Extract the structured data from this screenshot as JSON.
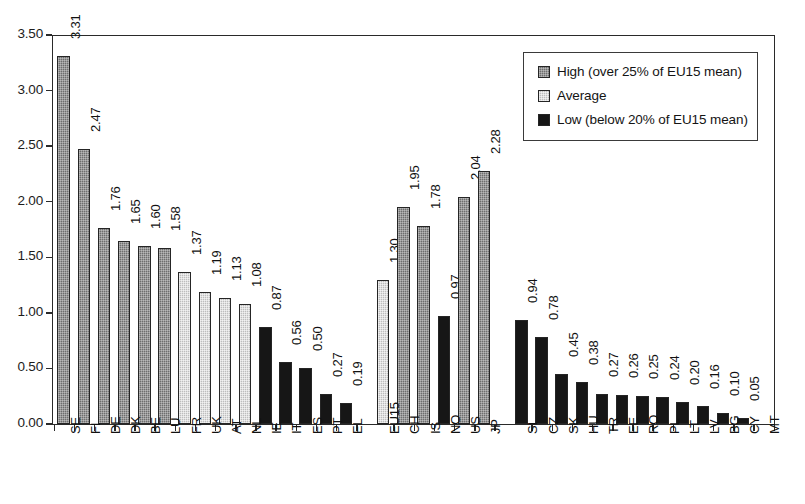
{
  "chart_data": {
    "type": "bar",
    "title": "",
    "xlabel": "",
    "ylabel": "",
    "ylim": [
      0.0,
      3.5
    ],
    "ytick_step": 0.5,
    "ytick_labels": [
      "0.00",
      "0.50",
      "1.00",
      "1.50",
      "2.00",
      "2.50",
      "3.00",
      "3.50"
    ],
    "grid": false,
    "legend_position": "top-right",
    "value_labels_rotated": true,
    "category_labels_rotated": true,
    "categories": [
      "SE",
      "FI",
      "DE",
      "DK",
      "BE",
      "LU",
      "FR",
      "UK",
      "AT",
      "NL",
      "IE",
      "IT",
      "ES",
      "PT",
      "EL",
      "EU15",
      "CH",
      "IS",
      "NO",
      "US",
      "JP",
      "SI",
      "CZ",
      "SK",
      "HU",
      "TR",
      "EE",
      "RO",
      "PL",
      "LT",
      "LV",
      "BG",
      "CY",
      "MT"
    ],
    "values": [
      3.31,
      2.47,
      1.76,
      1.65,
      1.6,
      1.58,
      1.37,
      1.19,
      1.13,
      1.08,
      0.87,
      0.56,
      0.5,
      0.27,
      0.19,
      1.3,
      1.95,
      1.78,
      0.97,
      2.04,
      2.28,
      0.94,
      0.78,
      0.45,
      0.38,
      0.27,
      0.26,
      0.25,
      0.24,
      0.2,
      0.16,
      0.1,
      0.05,
      0.0
    ],
    "value_labels": [
      "3.31",
      "2.47",
      "1.76",
      "1.65",
      "1.60",
      "1.58",
      "1.37",
      "1.19",
      "1.13",
      "1.08",
      "0.87",
      "0.56",
      "0.50",
      "0.27",
      "0.19",
      "1.30",
      "1.95",
      "1.78",
      "0.97",
      "2.04",
      "2.28",
      "0.94",
      "0.78",
      "0.45",
      "0.38",
      "0.27",
      "0.26",
      "0.25",
      "0.24",
      "0.20",
      "0.16",
      "0.10",
      "0.05",
      ""
    ],
    "series_of_bar": [
      "high",
      "high",
      "high",
      "high",
      "high",
      "high",
      "average",
      "average",
      "average",
      "average",
      "low",
      "low",
      "low",
      "low",
      "low",
      "average",
      "high",
      "high",
      "low",
      "high",
      "high",
      "low",
      "low",
      "low",
      "low",
      "low",
      "low",
      "low",
      "low",
      "low",
      "low",
      "low",
      "low",
      "low"
    ],
    "group_breaks_after": [
      "EL",
      "JP"
    ],
    "series": [
      {
        "name": "High (over 25% of EU15 mean)",
        "key": "high",
        "color": "#6e6e6e"
      },
      {
        "name": "Average",
        "key": "average",
        "color": "#bdbdbd"
      },
      {
        "name": "Low (below 20% of EU15 mean)",
        "key": "low",
        "color": "#161616"
      }
    ]
  },
  "legend": {
    "items": [
      {
        "label": "High (over 25% of EU15 mean)",
        "key": "high"
      },
      {
        "label": "Average",
        "key": "average"
      },
      {
        "label": "Low (below 20% of EU15 mean)",
        "key": "low"
      }
    ]
  }
}
